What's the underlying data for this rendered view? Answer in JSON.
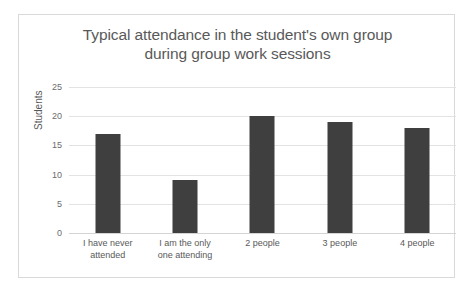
{
  "chart_data": {
    "type": "bar",
    "title": "Typical attendance in the student's own group during group work sessions",
    "title_lines": [
      "Typical attendance in the student's own group",
      "during group work sessions"
    ],
    "categories": [
      "I have never attended",
      "I am the only one attending",
      "2 people",
      "3 people",
      "4 people"
    ],
    "category_lines": [
      [
        "I have never",
        "attended"
      ],
      [
        "I am the only",
        "one attending"
      ],
      [
        "2 people"
      ],
      [
        "3 people"
      ],
      [
        "4 people"
      ]
    ],
    "values": [
      17,
      9,
      20,
      19,
      18
    ],
    "xlabel": "",
    "ylabel": "Students",
    "ylim": [
      0,
      25
    ],
    "yticks": [
      0,
      5,
      10,
      15,
      20,
      25
    ],
    "ytick_labels": [
      "0",
      "5",
      "10",
      "15",
      "20",
      "25"
    ],
    "grid": "horizontal",
    "legend": "none",
    "bar_color": "#3f3f3f",
    "gridline_color": "#e3e3e3",
    "title_color": "#595959",
    "tick_color": "#6b6b6b",
    "plot_background": "#ffffff",
    "border_color": "#d9d9d9"
  }
}
